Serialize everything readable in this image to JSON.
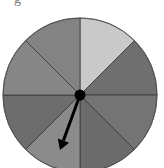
{
  "diagram": {
    "type": "spinner",
    "top_fragment": "g",
    "center": [
      80,
      95
    ],
    "radius": 77,
    "sectors": [
      {
        "index": 0,
        "start_deg": 0,
        "end_deg": 45,
        "color": "#c9c9c9"
      },
      {
        "index": 1,
        "start_deg": 45,
        "end_deg": 90,
        "color": "#6f6f6f"
      },
      {
        "index": 2,
        "start_deg": 90,
        "end_deg": 135,
        "color": "#747474"
      },
      {
        "index": 3,
        "start_deg": 135,
        "end_deg": 180,
        "color": "#6b6b6b"
      },
      {
        "index": 4,
        "start_deg": 180,
        "end_deg": 225,
        "color": "#8b8b8b"
      },
      {
        "index": 5,
        "start_deg": 225,
        "end_deg": 270,
        "color": "#6d6d6d"
      },
      {
        "index": 6,
        "start_deg": 270,
        "end_deg": 315,
        "color": "#868686"
      },
      {
        "index": 7,
        "start_deg": 315,
        "end_deg": 360,
        "color": "#838383"
      }
    ],
    "arrow": {
      "from": [
        80,
        95
      ],
      "to": [
        60,
        150
      ],
      "color": "#000000"
    },
    "divider_color": "#3a3a3a"
  }
}
